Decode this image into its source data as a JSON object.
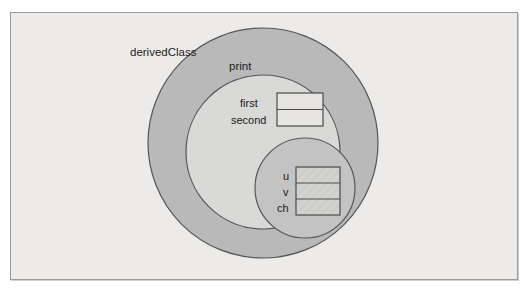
{
  "figure": {
    "type": "nested-scope-venn-diagram",
    "background_color": "#ecebe9",
    "frame_border_color": "#9a9a98"
  },
  "regions": {
    "outer": {
      "label": "derivedClass",
      "fill_color": "#b9b9b9",
      "stroke_color": "#555555",
      "center_x": 263,
      "center_y": 143,
      "radius": 115
    },
    "middle": {
      "label": "print",
      "fill_color": "#d9d9d7",
      "stroke_color": "#555555",
      "center_x": 263,
      "center_y": 152,
      "radius": 77
    },
    "inner": {
      "label": "",
      "fill_color": "#c3c3c3",
      "stroke_color": "#555555",
      "center_x": 305,
      "center_y": 188,
      "radius": 50
    }
  },
  "boxes": [
    {
      "name": "print-locals",
      "x": 277,
      "y": 93,
      "width": 46,
      "height": 33,
      "fill_color": "#e6e5e3",
      "stroke_color": "#4a4a4a",
      "cells": [
        {
          "label": "first",
          "value": ""
        },
        {
          "label": "second",
          "value": ""
        }
      ]
    },
    {
      "name": "inner-locals",
      "x": 296,
      "y": 167,
      "width": 44,
      "height": 48,
      "fill_color": "#d2d2d0",
      "stroke_color": "#4a4a4a",
      "cells": [
        {
          "label": "u",
          "value": ""
        },
        {
          "label": "v",
          "value": ""
        },
        {
          "label": "ch",
          "value": ""
        }
      ]
    }
  ],
  "labels": {
    "derived_class": "derivedClass",
    "print": "print",
    "first": "first",
    "second": "second",
    "u": "u",
    "v": "v",
    "ch": "ch"
  }
}
